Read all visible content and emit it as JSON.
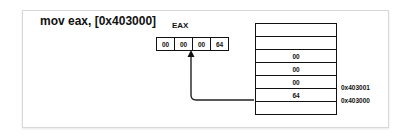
{
  "diagram": {
    "instruction": "mov eax, [0x403000]",
    "register": {
      "label": "EAX",
      "bytes": [
        "00",
        "00",
        "00",
        "64"
      ]
    },
    "memory": {
      "rows": [
        {
          "value": ""
        },
        {
          "value": ""
        },
        {
          "value": "00"
        },
        {
          "value": "00"
        },
        {
          "value": "00",
          "address": "0x403001"
        },
        {
          "value": "64",
          "address": "0x403000"
        },
        {
          "value": ""
        }
      ]
    },
    "arrow": {
      "from": "memory row 0x403000",
      "to": "EAX byte 3"
    }
  }
}
